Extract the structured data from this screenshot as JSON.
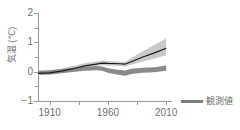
{
  "chart_data": {
    "type": "line",
    "title": "",
    "xlabel": "",
    "ylabel": "気温 (℃)",
    "xlim": [
      1900,
      2015
    ],
    "ylim": [
      -1,
      2
    ],
    "grid": false,
    "legend_position": "right",
    "y_ticks": [
      {
        "value": 2,
        "label": "2",
        "major": true
      },
      {
        "value": 1.5,
        "label": "",
        "major": false
      },
      {
        "value": 1,
        "label": "1",
        "major": true
      },
      {
        "value": 0.5,
        "label": "",
        "major": false
      },
      {
        "value": 0,
        "label": "0",
        "major": true
      },
      {
        "value": -0.5,
        "label": "",
        "major": false
      },
      {
        "value": -1,
        "label": "−1",
        "major": true
      }
    ],
    "x_ticks": [
      {
        "value": 1910,
        "label": "1910"
      },
      {
        "value": 1935,
        "label": ""
      },
      {
        "value": 1960,
        "label": "1960"
      },
      {
        "value": 1985,
        "label": ""
      },
      {
        "value": 2010,
        "label": "2010"
      }
    ],
    "series": [
      {
        "name": "観測値",
        "kind": "line",
        "color": "#1a1a1a",
        "x": [
          1900,
          1910,
          1920,
          1930,
          1940,
          1950,
          1955,
          1960,
          1970,
          1975,
          1980,
          1990,
          2000,
          2010
        ],
        "values": [
          -0.06,
          -0.04,
          0.02,
          0.1,
          0.2,
          0.26,
          0.29,
          0.28,
          0.27,
          0.26,
          0.34,
          0.5,
          0.64,
          0.8
        ]
      },
      {
        "name": "全強制力バンド",
        "kind": "band",
        "color": "#c9c9c9",
        "x": [
          1900,
          1910,
          1920,
          1930,
          1940,
          1950,
          1955,
          1960,
          1970,
          1975,
          1980,
          1990,
          2000,
          2010
        ],
        "upper": [
          0.02,
          0.04,
          0.1,
          0.19,
          0.29,
          0.35,
          0.38,
          0.36,
          0.34,
          0.33,
          0.47,
          0.7,
          0.92,
          1.14
        ],
        "lower": [
          -0.12,
          -0.11,
          -0.05,
          0.03,
          0.13,
          0.19,
          0.22,
          0.21,
          0.19,
          0.18,
          0.24,
          0.35,
          0.45,
          0.56
        ]
      },
      {
        "name": "自然起源バンド",
        "kind": "band",
        "color": "#8a8a8a",
        "x": [
          1900,
          1910,
          1920,
          1930,
          1940,
          1950,
          1955,
          1960,
          1970,
          1975,
          1980,
          1990,
          2000,
          2010
        ],
        "upper": [
          0.03,
          0.05,
          0.09,
          0.13,
          0.17,
          0.19,
          0.18,
          0.12,
          0.06,
          0.04,
          0.1,
          0.13,
          0.15,
          0.21
        ],
        "lower": [
          -0.1,
          -0.09,
          -0.05,
          -0.01,
          0.03,
          0.05,
          0.03,
          -0.04,
          -0.11,
          -0.14,
          -0.08,
          -0.04,
          -0.02,
          0.03
        ]
      }
    ]
  },
  "legend": {
    "entries": [
      {
        "label": "観測値",
        "color": "#7d7d7d"
      }
    ]
  }
}
